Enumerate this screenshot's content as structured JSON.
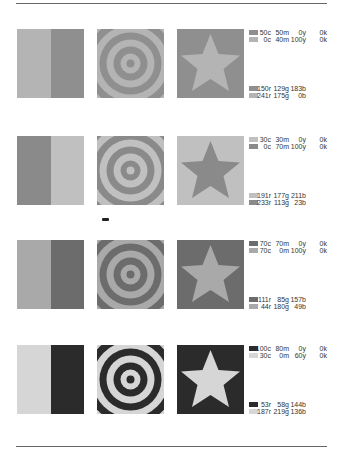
{
  "rows": [
    {
      "colorA": "#8f8f8f",
      "colorB": "#b4b4b4",
      "cmyk": [
        {
          "swatch": "A",
          "c": "50c",
          "m": "50m",
          "y": "0y",
          "k": "0k"
        },
        {
          "swatch": "B",
          "c": "0c",
          "m": "40m",
          "y": "100y",
          "k": "0k"
        }
      ],
      "rgb": [
        {
          "swatch": "A",
          "r": "150r",
          "g": "129g",
          "b": "183b"
        },
        {
          "swatch": "B",
          "r": "241r",
          "g": "175g",
          "b": "0b"
        }
      ]
    },
    {
      "colorA": "#c0c0c0",
      "colorB": "#8a8a8a",
      "cmyk": [
        {
          "swatch": "A",
          "c": "30c",
          "m": "30m",
          "y": "0y",
          "k": "0k"
        },
        {
          "swatch": "B",
          "c": "0c",
          "m": "70m",
          "y": "100y",
          "k": "0k"
        }
      ],
      "rgb": [
        {
          "swatch": "A",
          "r": "191r",
          "g": "177g",
          "b": "211b"
        },
        {
          "swatch": "B",
          "r": "233r",
          "g": "113g",
          "b": "23b"
        }
      ]
    },
    {
      "colorA": "#6c6c6c",
      "colorB": "#a9a9a9",
      "cmyk": [
        {
          "swatch": "A",
          "c": "70c",
          "m": "70m",
          "y": "0y",
          "k": "0k"
        },
        {
          "swatch": "B",
          "c": "70c",
          "m": "0m",
          "y": "100y",
          "k": "0k"
        }
      ],
      "rgb": [
        {
          "swatch": "A",
          "r": "111r",
          "g": "85g",
          "b": "157b"
        },
        {
          "swatch": "B",
          "r": "44r",
          "g": "180g",
          "b": "49b"
        }
      ]
    },
    {
      "colorA": "#2b2b2b",
      "colorB": "#d6d6d6",
      "cmyk": [
        {
          "swatch": "A",
          "c": "100c",
          "m": "80m",
          "y": "0y",
          "k": "0k"
        },
        {
          "swatch": "B",
          "c": "30c",
          "m": "0m",
          "y": "60y",
          "k": "0k"
        }
      ],
      "rgb": [
        {
          "swatch": "A",
          "r": "53r",
          "g": "58g",
          "b": "144b"
        },
        {
          "swatch": "B",
          "r": "187r",
          "g": "219g",
          "b": "136b"
        }
      ]
    }
  ]
}
